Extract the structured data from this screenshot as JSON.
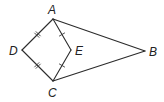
{
  "diagram": {
    "type": "geometry",
    "points": {
      "A": {
        "label": "A",
        "x": 53,
        "y": 19,
        "label_x": 48,
        "label_y": 14
      },
      "B": {
        "label": "B",
        "x": 145,
        "y": 51,
        "label_x": 149,
        "label_y": 56
      },
      "C": {
        "label": "C",
        "x": 53,
        "y": 81,
        "label_x": 48,
        "label_y": 97
      },
      "D": {
        "label": "D",
        "x": 22,
        "y": 50,
        "label_x": 9,
        "label_y": 55
      },
      "E": {
        "label": "E",
        "x": 71,
        "y": 50,
        "label_x": 75,
        "label_y": 55
      }
    },
    "segments": [
      {
        "from": "A",
        "to": "D",
        "ticks": 2
      },
      {
        "from": "D",
        "to": "C",
        "ticks": 2
      },
      {
        "from": "A",
        "to": "E",
        "ticks": 1
      },
      {
        "from": "E",
        "to": "C",
        "ticks": 1
      },
      {
        "from": "A",
        "to": "B",
        "ticks": 0
      },
      {
        "from": "C",
        "to": "B",
        "ticks": 0
      }
    ],
    "congruences": [
      "DA = DC",
      "EA = EC"
    ],
    "colors": {
      "line": "#2b2b2b",
      "label": "#222222",
      "background": "#ffffff"
    }
  }
}
